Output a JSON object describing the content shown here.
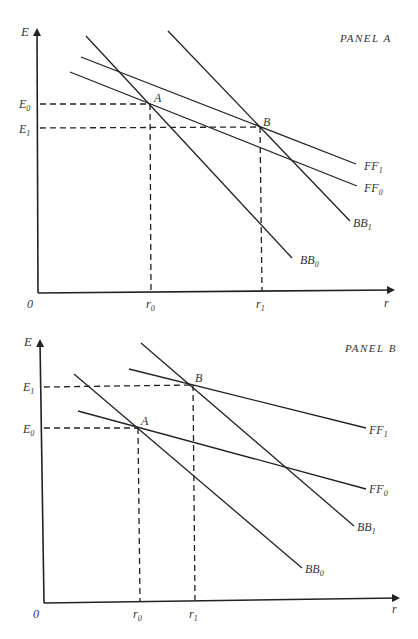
{
  "panels": [
    {
      "title": "PANEL A",
      "axes": {
        "y_label": "E",
        "x_label": "r",
        "origin_label": "0"
      },
      "y_ticks": [
        "E0",
        "E1"
      ],
      "x_ticks": [
        "r0",
        "r1"
      ],
      "points": [
        "A",
        "B"
      ],
      "curves": [
        "FF1",
        "FF0",
        "BB1",
        "BB0"
      ]
    },
    {
      "title": "PANEL B",
      "axes": {
        "y_label": "E",
        "x_label": "r",
        "origin_label": "0"
      },
      "y_ticks": [
        "E1",
        "E0"
      ],
      "x_ticks": [
        "r0",
        "r1"
      ],
      "points": [
        "A",
        "B"
      ],
      "curves": [
        "FF1",
        "FF0",
        "BB1",
        "BB0"
      ]
    }
  ],
  "text": {
    "E": "E",
    "r": "r",
    "zero": "0",
    "A": "A",
    "B": "B",
    "E_main": "E",
    "sub0": "0",
    "sub1": "1",
    "r_main": "r",
    "FF": "FF",
    "BB": "BB",
    "panelA": "PANEL A",
    "panelB": "PANEL B"
  }
}
